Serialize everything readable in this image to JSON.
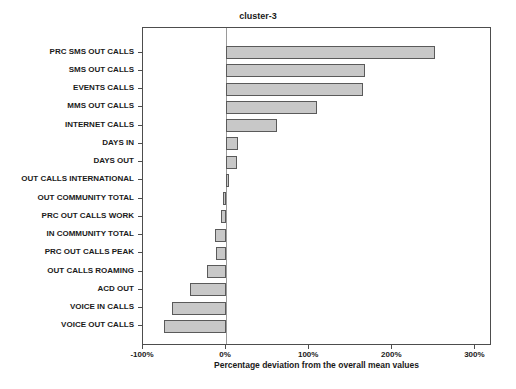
{
  "figure": {
    "title": "cluster-3",
    "xlabel": "Percentage deviation from the overall mean values"
  },
  "chart_data": {
    "type": "bar",
    "orientation": "horizontal",
    "title": "cluster-3",
    "xlabel": "Percentage deviation from the overall mean values",
    "ylabel": "",
    "categories": [
      "PRC SMS OUT CALLS",
      "SMS OUT CALLS",
      "EVENTS CALLS",
      "MMS OUT CALLS",
      "INTERNET CALLS",
      "DAYS IN",
      "DAYS OUT",
      "OUT CALLS INTERNATIONAL",
      "OUT COMMUNITY TOTAL",
      "PRC OUT CALLS WORK",
      "IN COMMUNITY TOTAL",
      "PRC OUT CALLS PEAK",
      "OUT CALLS ROAMING",
      "ACD OUT",
      "VOICE IN CALLS",
      "VOICE OUT CALLS"
    ],
    "values": [
      252,
      167,
      165,
      110,
      61,
      14,
      13,
      4,
      -4,
      -6,
      -13,
      -12,
      -23,
      -44,
      -65,
      -75
    ],
    "value_unit": "%",
    "xlim": [
      -100,
      320
    ],
    "xticks": [
      -100,
      0,
      100,
      200,
      300
    ],
    "xtick_labels": [
      "-100%",
      "0%",
      "100%",
      "200%",
      "300%"
    ],
    "grid": false,
    "zero_line": true,
    "legend": "none",
    "colors": {
      "bar_fill": "#c8c8c8",
      "bar_border": "#5a5a5a",
      "axis": "#4d4d4d",
      "background": "#ffffff",
      "text": "#1a1a1a"
    }
  }
}
